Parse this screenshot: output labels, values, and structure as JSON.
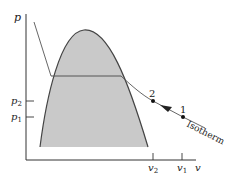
{
  "diagram": {
    "type": "p-v diagram",
    "axes": {
      "y_label": "p",
      "x_label": "v"
    },
    "y_ticks": [
      {
        "label": "p",
        "sub": "2"
      },
      {
        "label": "p",
        "sub": "1"
      }
    ],
    "x_ticks": [
      {
        "label": "v",
        "sub": "2"
      },
      {
        "label": "v",
        "sub": "1"
      }
    ],
    "points": [
      {
        "label": "2"
      },
      {
        "label": "1"
      }
    ],
    "curve_label": "Isotherm",
    "colors": {
      "dome_fill": "#c8c8c8",
      "line": "#333333",
      "axis": "#333333"
    }
  }
}
